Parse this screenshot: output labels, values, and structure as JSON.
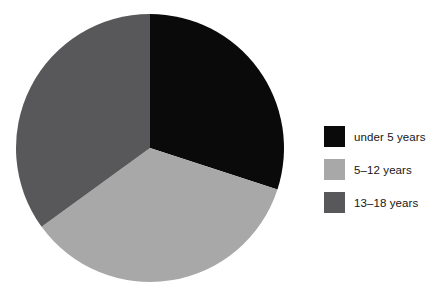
{
  "chart_data": {
    "type": "pie",
    "title": "",
    "subtitle": "",
    "xlabel": "",
    "ylabel": "",
    "grid": false,
    "legend_position": "right",
    "start_angle_deg": 0,
    "direction": "clockwise",
    "categories": [
      "under 5 years",
      "5–12 years",
      "13–18 years"
    ],
    "values": [
      30,
      35,
      35
    ],
    "units": "percent",
    "colors": [
      "#0a0a0a",
      "#a8a8a8",
      "#58585a"
    ],
    "slices": [
      {
        "label": "under 5 years",
        "value": 30,
        "color": "#0a0a0a",
        "start_angle_deg": 0,
        "end_angle_deg": 108
      },
      {
        "label": "5–12 years",
        "value": 35,
        "color": "#a8a8a8",
        "start_angle_deg": 108,
        "end_angle_deg": 234
      },
      {
        "label": "13–18 years",
        "value": 35,
        "color": "#58585a",
        "start_angle_deg": 234,
        "end_angle_deg": 360
      }
    ],
    "geometry": {
      "center_x": 150,
      "center_y": 148,
      "radius": 134
    }
  },
  "legend": {
    "items": [
      {
        "label": "under 5 years",
        "color": "#0a0a0a",
        "swatch_name": "legend-swatch-under-5-years"
      },
      {
        "label": "5–12 years",
        "color": "#a8a8a8",
        "swatch_name": "legend-swatch-5-12-years"
      },
      {
        "label": "13–18 years",
        "color": "#58585a",
        "swatch_name": "legend-swatch-13-18-years"
      }
    ]
  },
  "canvas": {
    "background": "#ffffff",
    "width": 437,
    "height": 304
  }
}
